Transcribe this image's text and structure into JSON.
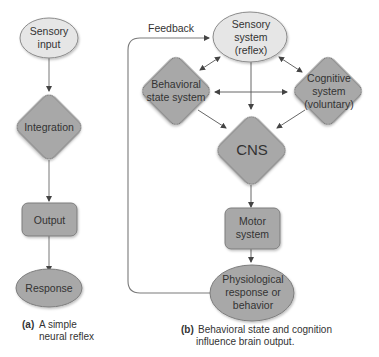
{
  "colors": {
    "light_node": "#e4e4e4",
    "dark_node": "#a6a6a6",
    "stroke": "#7a7a7a",
    "arrow": "#555555",
    "text": "#333333"
  },
  "panel_a": {
    "nodes": {
      "sensory_input": {
        "line1": "Sensory",
        "line2": "input",
        "shape": "ellipse"
      },
      "integration": {
        "line1": "Integration",
        "shape": "diamond"
      },
      "output": {
        "line1": "Output",
        "shape": "rounded-rect"
      },
      "response": {
        "line1": "Response",
        "shape": "ellipse"
      }
    },
    "caption": {
      "label": "(a)",
      "line1": "A simple",
      "line2": "neural reflex"
    }
  },
  "panel_b": {
    "feedback_label": "Feedback",
    "nodes": {
      "sensory_system": {
        "line1": "Sensory",
        "line2": "system",
        "line3": "(reflex)",
        "shape": "ellipse"
      },
      "behavioral_state": {
        "line1": "Behavioral",
        "line2": "state system",
        "shape": "diamond"
      },
      "cognitive": {
        "line1": "Cognitive",
        "line2": "system",
        "line3": "(voluntary)",
        "shape": "diamond"
      },
      "cns": {
        "line1": "CNS",
        "shape": "diamond"
      },
      "motor": {
        "line1": "Motor",
        "line2": "system",
        "shape": "rounded-rect"
      },
      "physiological": {
        "line1": "Physiological",
        "line2": "response or",
        "line3": "behavior",
        "shape": "ellipse"
      }
    },
    "caption": {
      "label": "(b)",
      "line1": "Behavioral state and cognition",
      "line2": "influence brain output."
    }
  }
}
